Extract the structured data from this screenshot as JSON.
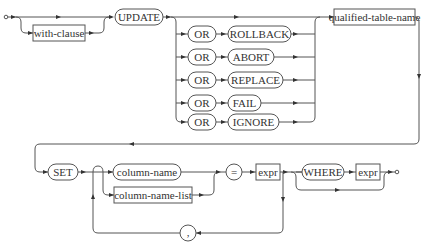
{
  "diagram": {
    "nodes": {
      "with_clause": "with-clause",
      "update": "UPDATE",
      "or_rollback_or": "OR",
      "rollback": "ROLLBACK",
      "or_abort_or": "OR",
      "abort": "ABORT",
      "or_replace_or": "OR",
      "replace": "REPLACE",
      "or_fail_or": "OR",
      "fail": "FAIL",
      "or_ignore_or": "OR",
      "ignore": "IGNORE",
      "qualified_table_name": "qualified-table-name",
      "set": "SET",
      "column_name": "column-name",
      "column_name_list": "column-name-list",
      "comma": ",",
      "equals": "=",
      "expr1": "expr",
      "where": "WHERE",
      "expr2": "expr"
    },
    "node_types": {
      "terminal": [
        "UPDATE",
        "OR",
        "ROLLBACK",
        "ABORT",
        "REPLACE",
        "FAIL",
        "IGNORE",
        "SET",
        ",",
        "=",
        "WHERE"
      ],
      "nonterminal": [
        "with-clause",
        "qualified-table-name",
        "column-name",
        "column-name-list",
        "expr"
      ]
    }
  }
}
